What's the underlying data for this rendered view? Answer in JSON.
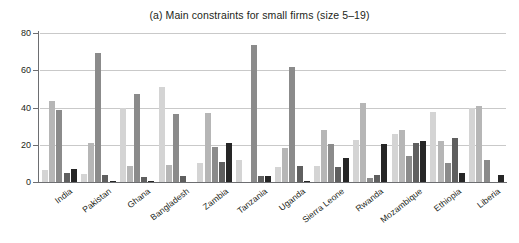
{
  "chart_data": {
    "type": "bar",
    "title": "(a) Main constraints for small firms (size 5–19)",
    "xlabel": "",
    "ylabel": "",
    "ylim": [
      0,
      80
    ],
    "yticks": [
      0,
      20,
      40,
      60,
      80
    ],
    "grid": true,
    "legend": "none",
    "categories": [
      "India",
      "Pakistan",
      "Ghana",
      "Bangladesh",
      "Zambia",
      "Tanzania",
      "Uganda",
      "Sierra Leone",
      "Rwanda",
      "Mozambique",
      "Ethiopia",
      "Liberia"
    ],
    "series": [
      {
        "name": "series-1",
        "color": "#d4d4d4",
        "values": [
          6.5,
          4.5,
          40.0,
          51.0,
          10.0,
          12.0,
          8.0,
          8.5,
          22.5,
          26.0,
          37.5,
          40.0
        ]
      },
      {
        "name": "series-2",
        "color": "#b6b6b6",
        "values": [
          43.5,
          21.0,
          8.5,
          9.0,
          37.0,
          0.0,
          18.0,
          28.0,
          42.5,
          28.0,
          22.0,
          41.0
        ]
      },
      {
        "name": "series-3",
        "color": "#8b8b8b",
        "values": [
          38.5,
          69.5,
          47.5,
          36.5,
          19.0,
          73.5,
          62.0,
          20.5,
          2.0,
          14.0,
          10.0,
          12.0
        ]
      },
      {
        "name": "series-4",
        "color": "#5f5f5f",
        "values": [
          5.0,
          4.0,
          2.5,
          3.0,
          11.0,
          3.0,
          8.5,
          8.0,
          4.0,
          21.0,
          23.5,
          0.0
        ]
      },
      {
        "name": "series-5",
        "color": "#262626",
        "values": [
          7.0,
          0.5,
          0.5,
          0.0,
          21.0,
          3.0,
          0.5,
          13.0,
          20.5,
          22.0,
          5.0,
          3.5
        ]
      }
    ]
  }
}
